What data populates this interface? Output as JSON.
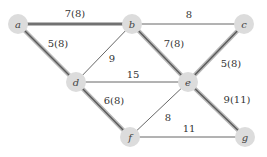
{
  "graph": {
    "colors": {
      "node_fill": "#dcdcdc",
      "thin_edge": "#555555",
      "thick_edge_outer": "#b8b8b8",
      "thick_edge_inner": "#5a5a5a",
      "label": "#333333"
    },
    "nodes": [
      {
        "id": "a",
        "label": "a",
        "x": 18,
        "y": 24
      },
      {
        "id": "b",
        "label": "b",
        "x": 132,
        "y": 24
      },
      {
        "id": "c",
        "label": "c",
        "x": 244,
        "y": 24
      },
      {
        "id": "d",
        "label": "d",
        "x": 76,
        "y": 82
      },
      {
        "id": "e",
        "label": "e",
        "x": 188,
        "y": 82
      },
      {
        "id": "f",
        "label": "f",
        "x": 130,
        "y": 137
      },
      {
        "id": "g",
        "label": "g",
        "x": 245,
        "y": 137
      }
    ],
    "edges": [
      {
        "from": "a",
        "to": "b",
        "label": "7(8)",
        "thick": true,
        "lx": 75,
        "ly": 17
      },
      {
        "from": "a",
        "to": "d",
        "label": "5(8)",
        "thick": true,
        "lx": 58,
        "ly": 47
      },
      {
        "from": "b",
        "to": "c",
        "label": "8",
        "thick": false,
        "lx": 189,
        "ly": 18
      },
      {
        "from": "b",
        "to": "d",
        "label": "9",
        "thick": false,
        "lx": 112,
        "ly": 62
      },
      {
        "from": "b",
        "to": "e",
        "label": "7(8)",
        "thick": true,
        "lx": 174,
        "ly": 47
      },
      {
        "from": "c",
        "to": "e",
        "label": "5(8)",
        "thick": true,
        "lx": 231,
        "ly": 67
      },
      {
        "from": "d",
        "to": "e",
        "label": "15",
        "thick": false,
        "lx": 133,
        "ly": 78
      },
      {
        "from": "d",
        "to": "f",
        "label": "6(8)",
        "thick": true,
        "lx": 114,
        "ly": 104
      },
      {
        "from": "e",
        "to": "f",
        "label": "8",
        "thick": false,
        "lx": 168,
        "ly": 121
      },
      {
        "from": "e",
        "to": "g",
        "label": "9(11)",
        "thick": true,
        "lx": 237,
        "ly": 103
      },
      {
        "from": "f",
        "to": "g",
        "label": "11",
        "thick": false,
        "lx": 189,
        "ly": 132
      }
    ]
  }
}
